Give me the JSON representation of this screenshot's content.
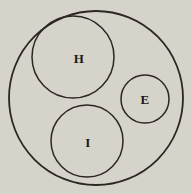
{
  "diagram": {
    "type": "euler-diagram",
    "background_color": "#d6d3cb",
    "line_color": "#2b2721",
    "text_color": "#1d1914",
    "outer_circle": {
      "cx": 96,
      "cy": 98,
      "r": 87
    },
    "circles": [
      {
        "label": "H",
        "cx": 73,
        "cy": 57,
        "r": 41,
        "label_x": 79,
        "label_y": 63
      },
      {
        "label": "E",
        "cx": 145,
        "cy": 99,
        "r": 24,
        "label_x": 145,
        "label_y": 104
      },
      {
        "label": "I",
        "cx": 87,
        "cy": 141,
        "r": 36,
        "label_x": 88,
        "label_y": 147
      }
    ]
  }
}
